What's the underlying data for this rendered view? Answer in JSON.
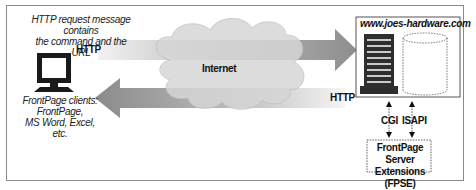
{
  "diagram": {
    "request_note": [
      "HTTP request message contains",
      "the command and the URL"
    ],
    "client_label": [
      "FrontPage clients:",
      "FrontPage,",
      "MS Word, Excel, etc."
    ],
    "http_top_label": "HTTP",
    "http_bottom_label": "HTTP",
    "cloud_label": "Internet",
    "server_title": "www.joes-hardware.com",
    "cgi_label": "CGI",
    "isapi_label": "ISAPI",
    "fpse_label": [
      "FrontPage Server",
      "Extensions (FPSE)"
    ],
    "colors": {
      "arrow_top": "#9a9a9a",
      "arrow_bottom": "#8c8c8c",
      "cloud_fill": "#d9d9d9",
      "server_dark": "#333333"
    }
  }
}
